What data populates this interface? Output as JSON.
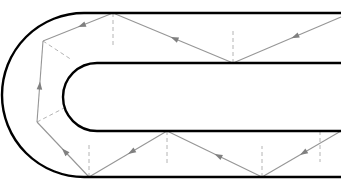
{
  "figure": {
    "title": "",
    "caption": "",
    "background_color": "#ffffff"
  },
  "colors": {
    "boundary": "#000000",
    "ray": "#969696",
    "normal_dashed": "#b4b4b4",
    "arrow": "#808080"
  },
  "strokes": {
    "boundary_width": 2.4,
    "ray_width": 1.1,
    "normal_width": 1.0,
    "normal_dash": "4,3"
  },
  "geometry": {
    "outer_wall": {
      "name": "outer-boundary",
      "path": "M 341,13 L 84,13 A 71,71 0 0 0 84,177 L 341,177",
      "right_end_x": 341,
      "top_y": 13,
      "bottom_y": 177,
      "bend_center_x": 84,
      "bend_center_y": 95,
      "bend_radius": 71
    },
    "inner_wall": {
      "name": "inner-boundary",
      "path": "M 341,63 L 97,63 A 34,34 0 0 0 97,131 L 341,131",
      "right_end_x": 341,
      "top_y": 63,
      "bottom_y": 131,
      "bend_center_x": 97,
      "bend_center_y": 97,
      "bend_radius": 34
    }
  },
  "rays": {
    "label": "light-ray-path",
    "direction": "enters from the right in the upper channel, reflects around the bend, exits to the right in the lower channel",
    "segments": [
      {
        "name": "ray-segment-entry-upper",
        "x1": 341,
        "y1": 17,
        "x2": 233,
        "y2": 63,
        "arrow_t": 0.46
      },
      {
        "name": "ray-segment-upper-2",
        "x1": 233,
        "y1": 63,
        "x2": 113,
        "y2": 13,
        "arrow_t": 0.52
      },
      {
        "name": "ray-segment-upper-3",
        "x1": 113,
        "y1": 13,
        "x2": 43,
        "y2": 41,
        "arrow_t": 0.5
      },
      {
        "name": "ray-segment-bend-vertical",
        "x1": 43,
        "y1": 41,
        "x2": 37,
        "y2": 122,
        "arrow_t": 0.5,
        "reverse_arrow": true
      },
      {
        "name": "ray-segment-lower-1",
        "x1": 37,
        "y1": 122,
        "x2": 89,
        "y2": 177,
        "arrow_t": 0.52,
        "reverse_arrow": true
      },
      {
        "name": "ray-segment-lower-2",
        "x1": 89,
        "y1": 177,
        "x2": 167,
        "y2": 131,
        "arrow_t": 0.5,
        "reverse_arrow": true
      },
      {
        "name": "ray-segment-lower-3",
        "x1": 167,
        "y1": 131,
        "x2": 262,
        "y2": 177,
        "arrow_t": 0.5,
        "reverse_arrow": true
      },
      {
        "name": "ray-segment-exit-lower",
        "x1": 262,
        "y1": 177,
        "x2": 341,
        "y2": 131,
        "arrow_t": 0.52,
        "reverse_arrow": true
      }
    ]
  },
  "normals": [
    {
      "name": "normal-line-upper-top",
      "x1": 113,
      "y1": 13,
      "x2": 113,
      "y2": 47
    },
    {
      "name": "normal-line-upper-inner",
      "x1": 233,
      "y1": 63,
      "x2": 233,
      "y2": 29
    },
    {
      "name": "normal-line-bend-upper",
      "x1": 43,
      "y1": 41,
      "x2": 72,
      "y2": 60
    },
    {
      "name": "normal-line-bend-lower",
      "x1": 37,
      "y1": 122,
      "x2": 68,
      "y2": 106
    },
    {
      "name": "normal-line-lower-outer",
      "x1": 89,
      "y1": 177,
      "x2": 89,
      "y2": 143
    },
    {
      "name": "normal-line-lower-inner",
      "x1": 167,
      "y1": 131,
      "x2": 167,
      "y2": 165
    },
    {
      "name": "normal-line-lower-mid",
      "x1": 262,
      "y1": 177,
      "x2": 262,
      "y2": 146
    },
    {
      "name": "normal-line-lower-right",
      "x1": 320,
      "y1": 131,
      "x2": 320,
      "y2": 162
    }
  ],
  "vertices": [
    {
      "name": "reflection-point-upper-top",
      "x": 113,
      "y": 13
    },
    {
      "name": "reflection-point-upper-inner",
      "x": 233,
      "y": 63
    },
    {
      "name": "reflection-point-bend-upper",
      "x": 43,
      "y": 41
    },
    {
      "name": "reflection-point-bend-lower",
      "x": 37,
      "y": 122
    },
    {
      "name": "reflection-point-lower-outer",
      "x": 89,
      "y": 177
    },
    {
      "name": "reflection-point-lower-inner",
      "x": 167,
      "y": 131
    },
    {
      "name": "reflection-point-lower-mid",
      "x": 262,
      "y": 177
    }
  ]
}
